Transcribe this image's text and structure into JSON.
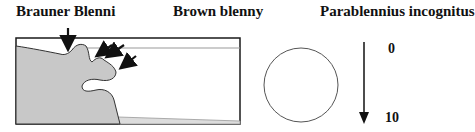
{
  "titles": {
    "german": "Brauner Blenni",
    "english": "Brown blenny",
    "latin": "Parablennius incognitus"
  },
  "scale": {
    "top_value": "0",
    "bottom_value": "10"
  },
  "colors": {
    "fill": "#c8c8c8",
    "stroke": "#1a1a1a",
    "water_line": "#9a9a9a"
  },
  "icons": {
    "arrows": "down-arrow, diagonal-arrows",
    "circle": "circle-symbol"
  }
}
